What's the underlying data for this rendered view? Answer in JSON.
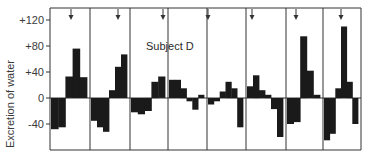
{
  "chart_data": {
    "type": "bar",
    "title": "Subject D",
    "xlabel": "",
    "ylabel": "Excretion of water",
    "ylim": [
      -80,
      140
    ],
    "yticks": [
      "+120",
      "+80",
      "+40",
      "0",
      "-40"
    ],
    "ytick_values": [
      120,
      80,
      40,
      0,
      -40
    ],
    "grid": false,
    "legend": null,
    "panel_dividers": 7,
    "arrows_per_panel": true,
    "panels": [
      {
        "values": [
          -48,
          -45,
          33,
          76,
          32
        ]
      },
      {
        "values": [
          -35,
          -45,
          -52,
          12,
          48,
          67
        ]
      },
      {
        "values": [
          -22,
          -25,
          -20,
          25,
          33
        ]
      },
      {
        "values": [
          28,
          28,
          15,
          -5,
          -18,
          5
        ]
      },
      {
        "values": [
          -10,
          -5,
          10,
          25,
          15,
          -45
        ]
      },
      {
        "values": [
          18,
          35,
          12,
          5,
          -17,
          -60
        ]
      },
      {
        "values": [
          -40,
          -37,
          95,
          42,
          5
        ]
      },
      {
        "values": [
          -65,
          -55,
          15,
          110,
          25,
          -40
        ]
      }
    ]
  },
  "labels": {
    "title": "Subject D",
    "ylabel": "Excretion of water"
  },
  "colors": {
    "bar": "#1a1a1a",
    "axis": "#333333"
  }
}
